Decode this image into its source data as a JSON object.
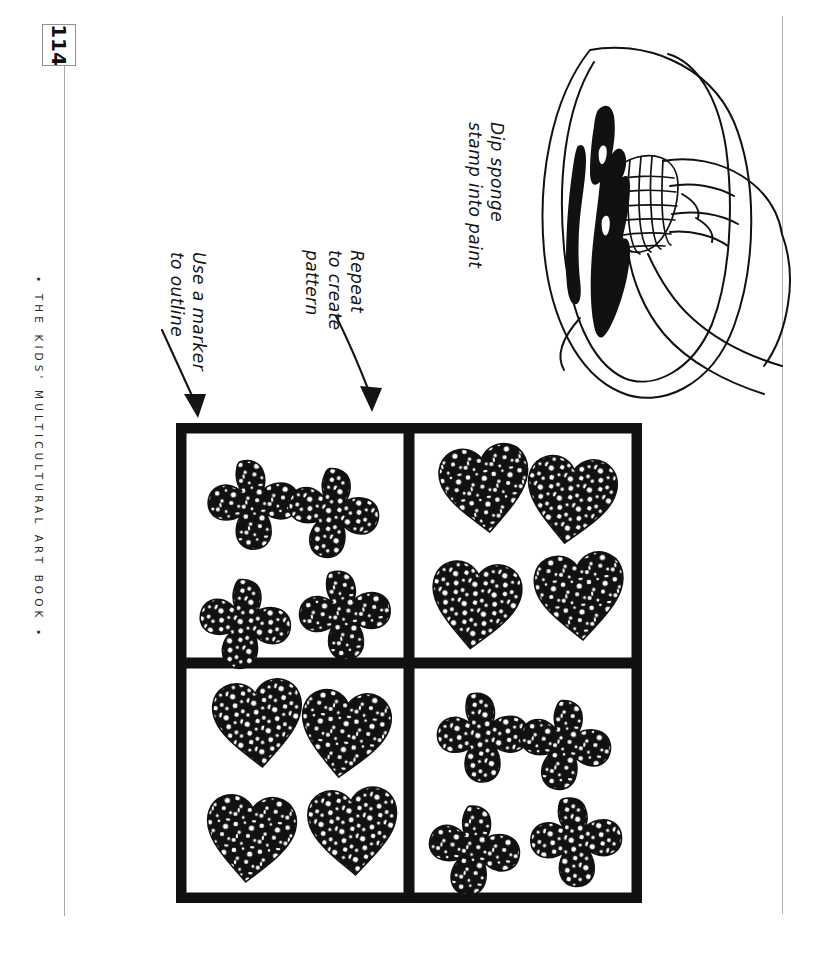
{
  "page": {
    "folio": "114",
    "running_footer": "• THE KIDS' MULTICULTURAL ART BOOK •",
    "ink_color": "#141414",
    "paper_color": "#ffffff",
    "rule_color": "#a9a9a9"
  },
  "annotations": [
    {
      "id": "dip-sponge",
      "lines": [
        "Dip sponge",
        "stamp into paint"
      ],
      "line1": "Dip sponge",
      "line2": "stamp into paint",
      "has_arrow": false
    },
    {
      "id": "repeat-pattern",
      "lines": [
        "Repeat",
        "to create",
        "pattern"
      ],
      "line1": "Repeat",
      "line2": "to create",
      "line3": "pattern",
      "has_arrow": true
    },
    {
      "id": "use-marker",
      "lines": [
        "Use a marker",
        "to outline"
      ],
      "line1": "Use a marker",
      "line2": "to outline",
      "has_arrow": true
    }
  ],
  "illustration": {
    "name": "hand-dipping-sponge-into-paint-dish",
    "elements": [
      "paint-dish",
      "black-paint-pool",
      "sponge-stamp",
      "hand"
    ]
  },
  "artwork": {
    "name": "sponge-stamped-pattern-grid",
    "outline_color": "#111111",
    "border_width_px": 11,
    "quadrants": [
      {
        "position": "top-left",
        "shape": "cross",
        "count": 4
      },
      {
        "position": "top-right",
        "shape": "heart",
        "count": 4
      },
      {
        "position": "bottom-left",
        "shape": "heart",
        "count": 4
      },
      {
        "position": "bottom-right",
        "shape": "cross",
        "count": 4
      }
    ]
  }
}
